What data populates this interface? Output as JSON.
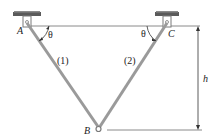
{
  "diagram": {
    "type": "truss-two-member",
    "colors": {
      "member": "#9a9a9a",
      "line": "#8a8a8a",
      "plate": "#5a5a5a",
      "text": "#222222"
    },
    "points": {
      "A": {
        "label": "A"
      },
      "B": {
        "label": "B"
      },
      "C": {
        "label": "C"
      }
    },
    "members": [
      {
        "id": "1",
        "label": "(1)",
        "from": "A",
        "to": "B"
      },
      {
        "id": "2",
        "label": "(2)",
        "from": "C",
        "to": "B"
      }
    ],
    "angles": [
      {
        "at": "A",
        "label": "θ"
      },
      {
        "at": "C",
        "label": "θ"
      }
    ],
    "dimension": {
      "label": "h"
    }
  }
}
